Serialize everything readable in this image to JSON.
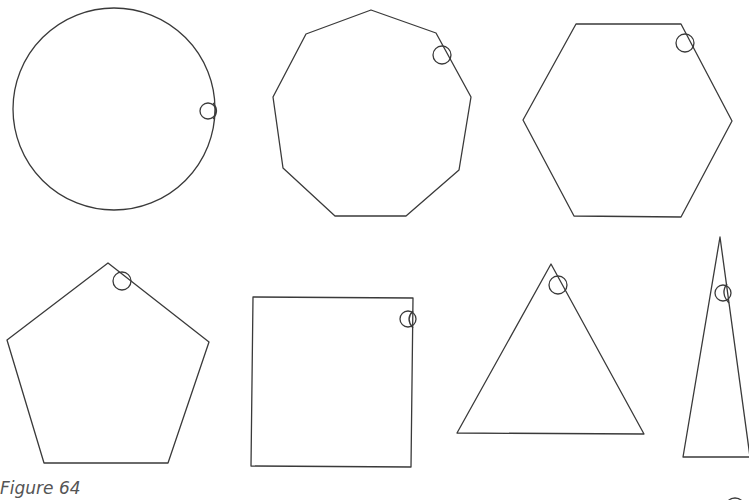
{
  "figure": {
    "caption": "Figure 64",
    "stroke_color": "#3a3a3a",
    "shapes": [
      {
        "name": "circle",
        "sides": 0,
        "marker": "small-circle-on-edge"
      },
      {
        "name": "nonagon",
        "sides": 9,
        "marker": "small-circle-at-vertex"
      },
      {
        "name": "hexagon",
        "sides": 6,
        "marker": "small-circle-at-vertex"
      },
      {
        "name": "pentagon",
        "sides": 5,
        "marker": "small-circle-at-vertex"
      },
      {
        "name": "square",
        "sides": 4,
        "marker": "small-circle-at-vertex"
      },
      {
        "name": "triangle",
        "sides": 3,
        "marker": "small-circle-at-vertex"
      },
      {
        "name": "narrow-triangle",
        "sides": 3,
        "marker": "small-circle-on-edge"
      }
    ]
  }
}
